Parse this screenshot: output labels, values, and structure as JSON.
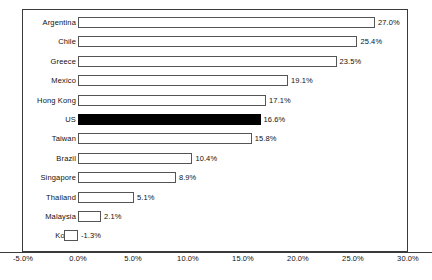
{
  "chart_data": {
    "type": "bar",
    "orientation": "horizontal",
    "title": "",
    "xlabel": "",
    "ylabel": "",
    "xlim": [
      -5.0,
      30.0
    ],
    "xticks": [
      "-5.0%",
      "0.0%",
      "5.0%",
      "10.0%",
      "15.0%",
      "20.0%",
      "25.0%",
      "30.0%"
    ],
    "xtick_values": [
      -5.0,
      0.0,
      5.0,
      10.0,
      15.0,
      20.0,
      25.0,
      30.0
    ],
    "grid": false,
    "legend": false,
    "categories": [
      "Argentina",
      "Chile",
      "Greece",
      "Mexico",
      "Hong Kong",
      "US",
      "Taiwan",
      "Brazil",
      "Singapore",
      "Thailand",
      "Malaysia",
      "Korea"
    ],
    "values": [
      27.0,
      25.4,
      23.5,
      19.1,
      17.1,
      16.6,
      15.8,
      10.4,
      8.9,
      5.1,
      2.1,
      -1.3
    ],
    "data_labels": [
      "27.0%",
      "25.4%",
      "23.5%",
      "19.1%",
      "17.1%",
      "16.6%",
      "15.8%",
      "10.4%",
      "8.9%",
      "5.1%",
      "2.1%",
      "-1.3%"
    ],
    "highlighted_category": "US",
    "colors": {
      "bar_fill": "#ffffff",
      "bar_edge": "#555555",
      "highlight_fill": "#000000",
      "axis": "#3a3a3a",
      "text": "#111111",
      "background": "#ffffff"
    }
  }
}
